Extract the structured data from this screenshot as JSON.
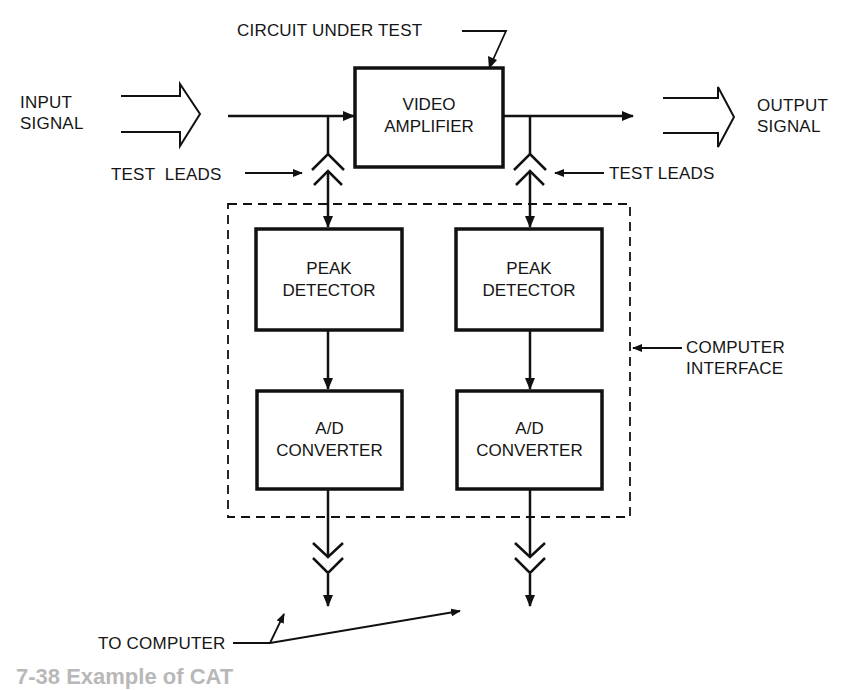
{
  "diagram": {
    "title_callout": "CIRCUIT UNDER TEST",
    "input": {
      "line1": "INPUT",
      "line2": "SIGNAL"
    },
    "output": {
      "line1": "OUTPUT",
      "line2": "SIGNAL"
    },
    "test_leads_left": "TEST  LEADS",
    "test_leads_right": "TEST LEADS",
    "computer_interface": {
      "line1": "COMPUTER",
      "line2": "INTERFACE"
    },
    "to_computer": "TO COMPUTER",
    "blocks": {
      "video_amplifier": {
        "line1": "VIDEO",
        "line2": "AMPLIFIER"
      },
      "peak_detector_left": {
        "line1": "PEAK",
        "line2": "DETECTOR"
      },
      "peak_detector_right": {
        "line1": "PEAK",
        "line2": "DETECTOR"
      },
      "ad_converter_left": {
        "line1": "A/D",
        "line2": "CONVERTER"
      },
      "ad_converter_right": {
        "line1": "A/D",
        "line2": "CONVERTER"
      }
    },
    "caption_truncated": "7-38  Example of CAT"
  }
}
